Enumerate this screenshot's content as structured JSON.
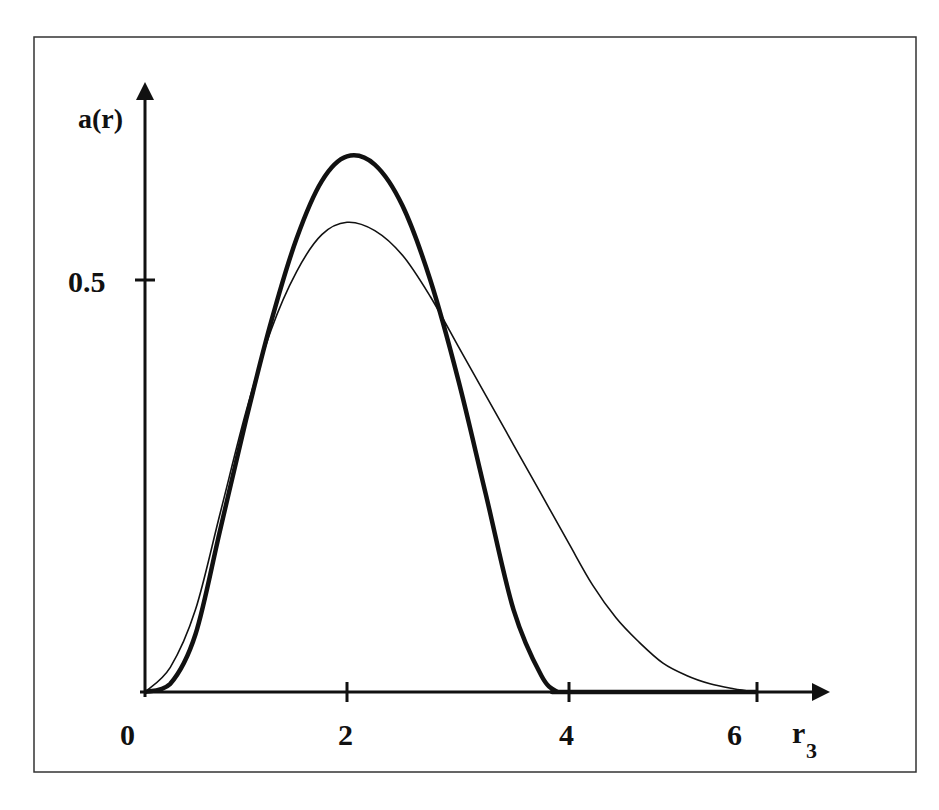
{
  "chart_data": {
    "type": "line",
    "title": "",
    "xlabel": "r",
    "xlabel_subscript": "3",
    "ylabel": "a(r)",
    "x_ticks": [
      "0",
      "2",
      "4",
      "6"
    ],
    "y_ticks": [
      "0.5"
    ],
    "xlim": [
      0,
      6.4
    ],
    "ylim": [
      0,
      0.75
    ],
    "grid": false,
    "legend": null,
    "series": [
      {
        "name": "bold curve",
        "style": "thick",
        "x": [
          0,
          0.25,
          0.5,
          0.75,
          1.0,
          1.25,
          1.5,
          1.75,
          2.0,
          2.25,
          2.5,
          2.75,
          3.0,
          3.25,
          3.5,
          3.75,
          3.9,
          4.0,
          6.0
        ],
        "y": [
          0,
          0.01,
          0.07,
          0.2,
          0.33,
          0.45,
          0.55,
          0.62,
          0.65,
          0.64,
          0.59,
          0.5,
          0.38,
          0.24,
          0.1,
          0.02,
          0.0,
          0.0,
          0.0
        ]
      },
      {
        "name": "thin curve",
        "style": "thin",
        "x": [
          0,
          0.25,
          0.5,
          0.75,
          1.0,
          1.25,
          1.5,
          1.75,
          2.0,
          2.25,
          2.5,
          2.75,
          3.0,
          3.25,
          3.5,
          3.75,
          4.0,
          4.25,
          4.5,
          4.75,
          5.0,
          5.25,
          5.5,
          5.75,
          6.0
        ],
        "y": [
          0,
          0.03,
          0.1,
          0.22,
          0.34,
          0.44,
          0.51,
          0.555,
          0.57,
          0.56,
          0.53,
          0.48,
          0.42,
          0.36,
          0.3,
          0.24,
          0.18,
          0.13,
          0.09,
          0.06,
          0.035,
          0.02,
          0.01,
          0.004,
          0.0
        ]
      }
    ]
  },
  "labels": {
    "y_axis": "a(r)",
    "x_axis_main": "r",
    "x_axis_sub": "3",
    "tick_0": "0",
    "tick_2": "2",
    "tick_4": "4",
    "tick_6": "6",
    "tick_05": "0.5"
  }
}
